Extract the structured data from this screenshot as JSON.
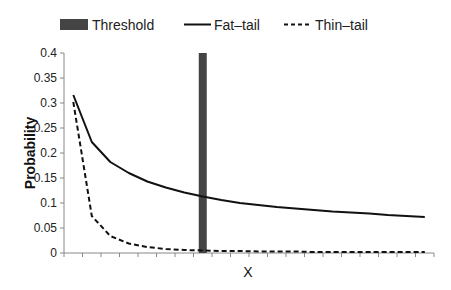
{
  "chart_data": {
    "type": "line",
    "title": "",
    "xlabel": "X",
    "ylabel": "Probability",
    "ylim": [
      0,
      0.4
    ],
    "yticks": [
      "0",
      "0.05",
      "0.1",
      "0.15",
      "0.2",
      "0.25",
      "0.3",
      "0.35",
      "0.4"
    ],
    "ytick_values": [
      0,
      0.05,
      0.1,
      0.15,
      0.2,
      0.25,
      0.3,
      0.35,
      0.4
    ],
    "num_categories": 20,
    "legend_position": "top",
    "threshold": {
      "name": "Threshold",
      "category_index": 7,
      "value": 0.4,
      "color": "#444444"
    },
    "series": [
      {
        "name": "Fat–tail",
        "style": "solid",
        "color": "#111111",
        "values": [
          0.316,
          0.222,
          0.182,
          0.16,
          0.143,
          0.131,
          0.121,
          0.113,
          0.106,
          0.1,
          0.096,
          0.092,
          0.089,
          0.086,
          0.083,
          0.081,
          0.079,
          0.076,
          0.074,
          0.072
        ]
      },
      {
        "name": "Thin–tail",
        "style": "dashed",
        "color": "#111111",
        "values": [
          0.302,
          0.074,
          0.034,
          0.019,
          0.012,
          0.008,
          0.006,
          0.005,
          0.004,
          0.004,
          0.003,
          0.003,
          0.003,
          0.002,
          0.002,
          0.002,
          0.002,
          0.002,
          0.002,
          0.002
        ]
      }
    ]
  },
  "legend": {
    "threshold_label": "Threshold",
    "fat_label": "Fat–tail",
    "thin_label": "Thin–tail"
  }
}
